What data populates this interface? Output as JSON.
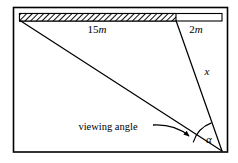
{
  "figure": {
    "type": "geometry-diagram",
    "title": "",
    "background_color": "#ffffff",
    "stroke_color": "#000000",
    "frame": {
      "name": "outer-border",
      "x": 13.5,
      "y": 7.5,
      "width": 214,
      "height": 144.5,
      "stroke_width": 1.6
    },
    "bar": {
      "name": "horizontal-bar",
      "x": 19.5,
      "y": 13.5,
      "width": 202.5,
      "height": 7.5,
      "hatched_end_x": 176,
      "hatch_angle_deg": 45,
      "hatch_spacing": 3
    },
    "labels": {
      "hatched_length": "15",
      "hatched_unit": "m",
      "hatched_full": "15m",
      "open_length": "2",
      "open_unit": "m",
      "open_full": "2m",
      "vertical_distance": "x",
      "angle_symbol": "α",
      "annotation": "viewing angle"
    },
    "label_positions": {
      "hatched_x": 97,
      "hatched_y": 33,
      "open_x": 196,
      "open_y": 33,
      "vertical_x": 207,
      "vertical_y": 75,
      "angle_x": 209,
      "angle_y": 143,
      "annotation_x": 108,
      "annotation_y": 130
    },
    "vertex": {
      "name": "observer-point",
      "x": 222,
      "y": 151
    },
    "rays": [
      {
        "name": "far-sightline",
        "x1": 20,
        "y1": 20.5,
        "x2": 222,
        "y2": 151
      },
      {
        "name": "near-sightline",
        "x1": 176,
        "y1": 20.5,
        "x2": 222,
        "y2": 151
      }
    ],
    "angle_arc": {
      "name": "viewing-angle-arc",
      "center_x": 222,
      "center_y": 151,
      "radius": 30,
      "start_x": 193.2,
      "start_y": 142.4,
      "end_x": 211.5,
      "end_y": 122.9
    },
    "pointer": {
      "name": "annotation-arrow",
      "path": "M 153 125 Q 175 124 189 136",
      "arrow_tip_x": 190,
      "arrow_tip_y": 137
    }
  }
}
